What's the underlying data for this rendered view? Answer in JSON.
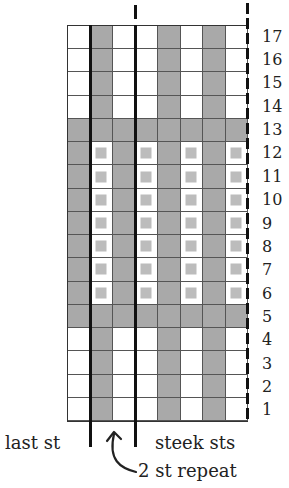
{
  "chart": {
    "columns": 8,
    "rows": 17,
    "row_labels": [
      "17",
      "16",
      "15",
      "14",
      "13",
      "12",
      "11",
      "10",
      "9",
      "8",
      "7",
      "6",
      "5",
      "4",
      "3",
      "2",
      "1"
    ],
    "colors": {
      "contrast": "#a9a9a9",
      "main": "#ffffff",
      "dot": "#bcbcbc",
      "line": "#111111"
    },
    "pattern": [
      [
        "w",
        "g",
        "w",
        "w",
        "g",
        "w",
        "g",
        "w"
      ],
      [
        "w",
        "g",
        "w",
        "w",
        "g",
        "w",
        "g",
        "w"
      ],
      [
        "w",
        "g",
        "w",
        "w",
        "g",
        "w",
        "g",
        "w"
      ],
      [
        "w",
        "g",
        "w",
        "w",
        "g",
        "w",
        "g",
        "w"
      ],
      [
        "g",
        "g",
        "g",
        "g",
        "g",
        "g",
        "g",
        "g"
      ],
      [
        "g",
        "d",
        "g",
        "d",
        "g",
        "d",
        "g",
        "d"
      ],
      [
        "g",
        "d",
        "g",
        "d",
        "g",
        "d",
        "g",
        "d"
      ],
      [
        "g",
        "d",
        "g",
        "d",
        "g",
        "d",
        "g",
        "d"
      ],
      [
        "g",
        "d",
        "g",
        "d",
        "g",
        "d",
        "g",
        "d"
      ],
      [
        "g",
        "d",
        "g",
        "d",
        "g",
        "d",
        "g",
        "d"
      ],
      [
        "g",
        "d",
        "g",
        "d",
        "g",
        "d",
        "g",
        "d"
      ],
      [
        "g",
        "d",
        "g",
        "d",
        "g",
        "d",
        "g",
        "d"
      ],
      [
        "g",
        "g",
        "g",
        "g",
        "g",
        "g",
        "g",
        "g"
      ],
      [
        "w",
        "g",
        "w",
        "w",
        "g",
        "w",
        "g",
        "w"
      ],
      [
        "w",
        "g",
        "w",
        "w",
        "g",
        "w",
        "g",
        "w"
      ],
      [
        "w",
        "g",
        "w",
        "w",
        "g",
        "w",
        "g",
        "w"
      ],
      [
        "w",
        "g",
        "w",
        "w",
        "g",
        "w",
        "g",
        "w"
      ]
    ]
  },
  "labels": {
    "last_st": "last st",
    "steek_sts": "steek sts",
    "repeat": "2 st repeat"
  }
}
